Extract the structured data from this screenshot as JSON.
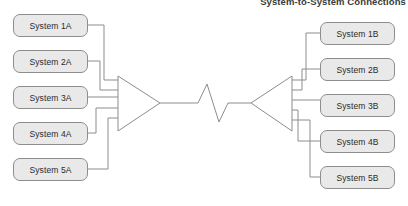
{
  "diagram": {
    "title": "System-to-System Connections",
    "title_truncated": true,
    "background_color": "#ffffff",
    "line_color": "#808080",
    "box_fill_color": "#e9e9e9",
    "box_border_color": "#8d8d8d",
    "text_color": "#2b2b2b",
    "left_group": {
      "label": "Site A systems",
      "boxes": [
        {
          "label": "System 1A",
          "x": 13,
          "y": 14
        },
        {
          "label": "System 2A",
          "x": 13,
          "y": 50
        },
        {
          "label": "System 3A",
          "x": 13,
          "y": 86
        },
        {
          "label": "System 4A",
          "x": 13,
          "y": 122
        },
        {
          "label": "System 5A",
          "x": 13,
          "y": 158
        }
      ]
    },
    "right_group": {
      "label": "Site B systems",
      "boxes": [
        {
          "label": "System 1B",
          "x": 320,
          "y": 22
        },
        {
          "label": "System 2B",
          "x": 320,
          "y": 58
        },
        {
          "label": "System 3B",
          "x": 320,
          "y": 94
        },
        {
          "label": "System 4B",
          "x": 320,
          "y": 130
        },
        {
          "label": "System 5B",
          "x": 320,
          "y": 166
        }
      ]
    },
    "left_funnel": {
      "name": "left-aggregation-triangle",
      "points": "118,76 118,131 160,103"
    },
    "right_funnel": {
      "name": "right-aggregation-triangle",
      "points": "292,76 292,131 251,103"
    },
    "trunk": {
      "name": "trunk-link",
      "left_segment": "160,103 198,103",
      "zigzag": "198,103 207,84 219,122 228,103",
      "right_segment": "228,103 251,103"
    },
    "left_connectors": [
      "88,25 104,25 104,80 118,80",
      "88,61 100,61 100,90 118,90",
      "88,97 118,97",
      "88,133 96,133 96,108 118,108",
      "88,169 108,169 108,118 118,118"
    ],
    "right_connectors": [
      "292,80 306,80 306,33 320,33",
      "292,90 302,90 302,69 320,69",
      "292,100 320,100",
      "292,110 298,110 298,141 320,141",
      "292,120 310,120 310,177 320,177"
    ]
  }
}
